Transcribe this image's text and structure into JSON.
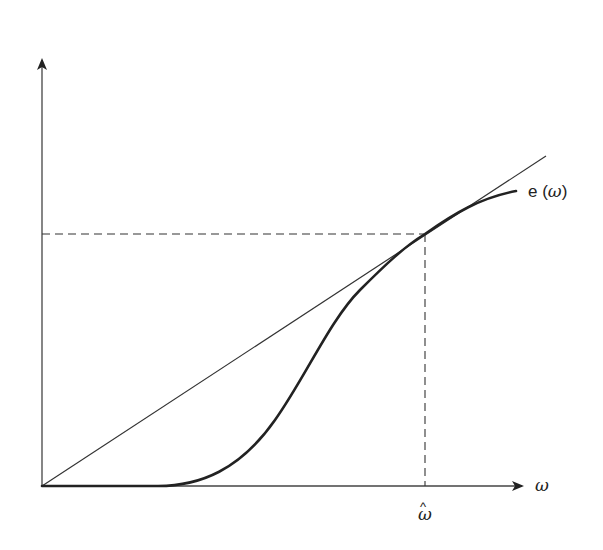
{
  "diagram": {
    "title": "",
    "x_axis": {
      "label": "ω",
      "tick_label": "ω̂",
      "tick_hat": "^",
      "tick_symbol": "ω"
    },
    "y_axis": {
      "label": ""
    },
    "curve": {
      "label_prefix": "e (",
      "label_symbol": "ω",
      "label_suffix": ")",
      "label": "e (ω)",
      "description": "S-shaped curve, flat at zero, rising and tangent to ray from origin at ω̂"
    },
    "ray": {
      "description": "Straight line from origin tangent to e(ω) at ω̂"
    },
    "guides": {
      "horizontal": "Dashed line from y-axis to tangent point",
      "vertical": "Dashed line from tangent point down to ω̂ on x-axis"
    },
    "colors": {
      "line": "#222222",
      "background": "#ffffff"
    }
  }
}
